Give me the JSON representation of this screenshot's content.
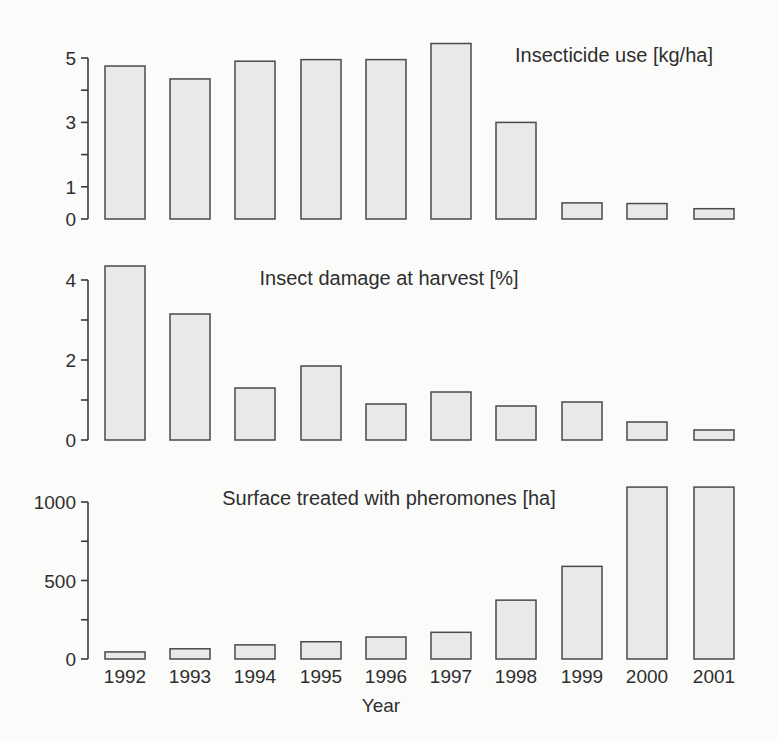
{
  "figure": {
    "x_axis_label": "Year",
    "colors": {
      "bar_fill": "#e9e9e7",
      "bar_stroke": "#4a4a4a",
      "text": "#2e2e2e",
      "background": "#fbfbfa"
    }
  },
  "chart_data": [
    {
      "type": "bar",
      "title": "Insecticide use [kg/ha]",
      "xlabel": "",
      "ylabel": "",
      "categories": [
        "1992",
        "1993",
        "1994",
        "1995",
        "1996",
        "1997",
        "1998",
        "1999",
        "2000",
        "2001"
      ],
      "values": [
        4.75,
        4.35,
        4.9,
        4.95,
        4.95,
        5.45,
        3.0,
        0.5,
        0.48,
        0.32
      ],
      "ylim": [
        0,
        5.5
      ],
      "yticks": [
        0,
        1,
        2,
        3,
        4,
        5
      ],
      "ytick_labels": [
        "0",
        "1",
        "",
        "3",
        "",
        "5"
      ],
      "grid": false,
      "legend": null
    },
    {
      "type": "bar",
      "title": "Insect damage at harvest [%]",
      "xlabel": "",
      "ylabel": "",
      "categories": [
        "1992",
        "1993",
        "1994",
        "1995",
        "1996",
        "1997",
        "1998",
        "1999",
        "2000",
        "2001"
      ],
      "values": [
        4.35,
        3.15,
        1.3,
        1.85,
        0.9,
        1.2,
        0.85,
        0.95,
        0.45,
        0.25
      ],
      "ylim": [
        0,
        4.4
      ],
      "yticks": [
        0,
        1,
        2,
        3,
        4
      ],
      "ytick_labels": [
        "0",
        "",
        "2",
        "",
        "4"
      ],
      "grid": false,
      "legend": null
    },
    {
      "type": "bar",
      "title": "Surface treated with pheromones [ha]",
      "xlabel": "Year",
      "ylabel": "",
      "categories": [
        "1992",
        "1993",
        "1994",
        "1995",
        "1996",
        "1997",
        "1998",
        "1999",
        "2000",
        "2001"
      ],
      "values": [
        45,
        65,
        90,
        110,
        140,
        170,
        375,
        590,
        1095,
        1095
      ],
      "ylim": [
        0,
        1100
      ],
      "yticks": [
        0,
        250,
        500,
        750,
        1000
      ],
      "ytick_labels": [
        "0",
        "",
        "500",
        "",
        "1000"
      ],
      "grid": false,
      "legend": null
    }
  ]
}
